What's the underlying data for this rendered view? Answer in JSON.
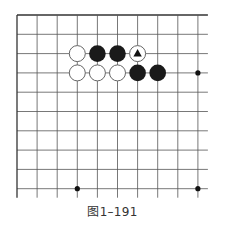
{
  "figure": {
    "caption": "图1–191",
    "board": {
      "origin_x": 17,
      "origin_y": 15,
      "spacing_x": 20.1,
      "spacing_y": 19.3,
      "cols": 10,
      "rows": 10,
      "open_right": true,
      "open_bottom": true,
      "line_color": "#555555",
      "edge_color": "#333333"
    },
    "star_points": [
      {
        "col": 9,
        "row": 3
      },
      {
        "col": 3,
        "row": 9
      },
      {
        "col": 9,
        "row": 9
      }
    ],
    "stones": [
      {
        "col": 3,
        "row": 2,
        "color": "white"
      },
      {
        "col": 4,
        "row": 2,
        "color": "black"
      },
      {
        "col": 5,
        "row": 2,
        "color": "black"
      },
      {
        "col": 6,
        "row": 2,
        "color": "white",
        "marker": "triangle"
      },
      {
        "col": 3,
        "row": 3,
        "color": "white"
      },
      {
        "col": 4,
        "row": 3,
        "color": "white"
      },
      {
        "col": 5,
        "row": 3,
        "color": "white"
      },
      {
        "col": 6,
        "row": 3,
        "color": "black"
      },
      {
        "col": 7,
        "row": 3,
        "color": "black"
      }
    ],
    "colors": {
      "black_stone": "#1a1a1a",
      "white_stone_fill": "#ffffff",
      "white_stone_stroke": "#666666",
      "marker": "#111111"
    }
  }
}
